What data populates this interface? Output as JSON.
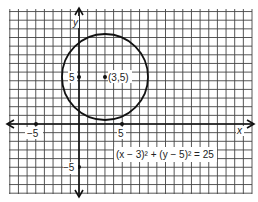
{
  "figure": {
    "equation": "(x − 3)² + (y − 5)² = 25",
    "center_label": "(3,5)",
    "x_axis_label": "x",
    "y_axis_label": "y",
    "tick_labels": {
      "x_neg": "−5",
      "x_pos": "5",
      "y_pos": "5",
      "y_neg": "−5"
    }
  },
  "chart_data": {
    "type": "scatter",
    "title": "",
    "xlabel": "x",
    "ylabel": "y",
    "circle": {
      "center": [
        3,
        5
      ],
      "radius": 5,
      "equation": "(x-3)^2 + (y-5)^2 = 25"
    },
    "points": [
      {
        "x": 3,
        "y": 5,
        "label": "(3,5)"
      },
      {
        "x": -5,
        "y": 0,
        "label": "-5"
      },
      {
        "x": 5,
        "y": 0,
        "label": "5"
      },
      {
        "x": 0,
        "y": 5,
        "label": "5"
      },
      {
        "x": 0,
        "y": -5,
        "label": "-5"
      }
    ],
    "xlim": [
      -8,
      20
    ],
    "ylim": [
      -8,
      13
    ],
    "grid": true
  },
  "colors": {
    "grid": "#3a3a3a",
    "ink": "#1a1a1a",
    "background": "#ffffff"
  }
}
